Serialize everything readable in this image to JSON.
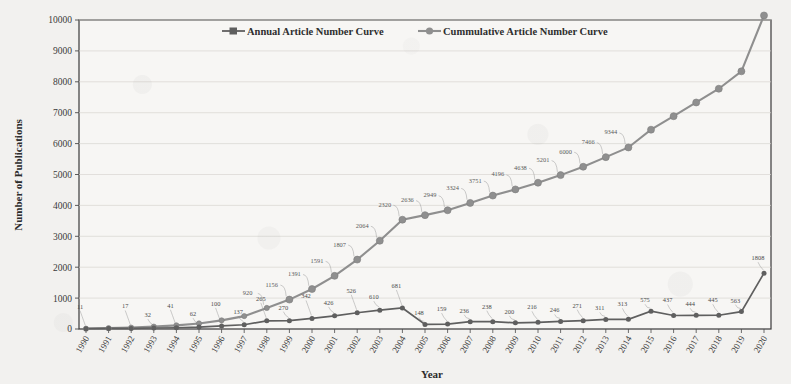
{
  "chart_data": {
    "type": "line",
    "title": "",
    "xlabel": "Year",
    "ylabel": "Number of Publications",
    "ylim": [
      0,
      10000
    ],
    "ytick_labels": [
      "0",
      "1000",
      "2000",
      "3000",
      "4000",
      "5000",
      "6000",
      "7000",
      "8000",
      "9000",
      "10000"
    ],
    "grid": true,
    "legend_position": "top-center",
    "categories": [
      "1990",
      "1991",
      "1992",
      "1993",
      "1994",
      "1995",
      "1996",
      "1997",
      "1998",
      "1999",
      "2000",
      "2001",
      "2002",
      "2003",
      "2004",
      "2005",
      "2006",
      "2007",
      "2008",
      "2009",
      "2010",
      "2011",
      "2012",
      "2013",
      "2014",
      "2015",
      "2016",
      "2017",
      "2018",
      "2019",
      "2020"
    ],
    "series": [
      {
        "name": "Annual Article Number Curve",
        "color": "#6b6b6b",
        "values": [
          11,
          17,
          32,
          41,
          62,
          100,
          137,
          265,
          270,
          342,
          426,
          526,
          610,
          681,
          920,
          148,
          159,
          236,
          238,
          200,
          216,
          246,
          271,
          311,
          313,
          575,
          437,
          444,
          445,
          563,
          799
        ]
      },
      {
        "name": "Cummulative Article Number Curve",
        "color": "#8f8f8f",
        "values": [
          11,
          28,
          60,
          101,
          163,
          263,
          400,
          665,
          935,
          1156,
          1391,
          1591,
          1807,
          2064,
          2320,
          2636,
          2949,
          3324,
          3751,
          4196,
          4638,
          5201,
          6000,
          7466,
          9344,
          9344,
          9344,
          9344,
          9344,
          9344,
          9344
        ]
      }
    ],
    "annual_labels": [
      "11",
      "17",
      "32",
      "41",
      "62",
      "100",
      "137",
      "265",
      "270",
      "342",
      "426",
      "526",
      "610",
      "681",
      "920",
      "148",
      "159",
      "236",
      "238",
      "200",
      "216",
      "246",
      "271",
      "311",
      "313",
      "575",
      "437",
      "444",
      "445",
      "563",
      "799",
      "1808"
    ],
    "cumulative_labels": [
      "1156",
      "1391",
      "1591",
      "1807",
      "2064",
      "2320",
      "2636",
      "2949",
      "3324",
      "3751",
      "4196",
      "4638",
      "5201",
      "6000",
      "7466",
      "9344"
    ]
  },
  "series_annual": {
    "name": "Annual Article Number Curve",
    "points": [
      {
        "year": "1990",
        "value": 11,
        "label": "11"
      },
      {
        "year": "1991",
        "value": 17,
        "label": ""
      },
      {
        "year": "1992",
        "value": 17,
        "label": "17"
      },
      {
        "year": "1993",
        "value": 32,
        "label": "32"
      },
      {
        "year": "1994",
        "value": 41,
        "label": "41"
      },
      {
        "year": "1995",
        "value": 62,
        "label": "62"
      },
      {
        "year": "1996",
        "value": 100,
        "label": "100"
      },
      {
        "year": "1997",
        "value": 137,
        "label": "137"
      },
      {
        "year": "1998",
        "value": 265,
        "label": "265"
      },
      {
        "year": "1999",
        "value": 270,
        "label": "270"
      },
      {
        "year": "2000",
        "value": 342,
        "label": "342"
      },
      {
        "year": "2001",
        "value": 426,
        "label": "426"
      },
      {
        "year": "2002",
        "value": 526,
        "label": "526"
      },
      {
        "year": "2003",
        "value": 610,
        "label": "610"
      },
      {
        "year": "2004",
        "value": 681,
        "label": "681"
      },
      {
        "year": "2005",
        "value": 148,
        "label": "148"
      },
      {
        "year": "2006",
        "value": 159,
        "label": "159"
      },
      {
        "year": "2007",
        "value": 236,
        "label": "236"
      },
      {
        "year": "2008",
        "value": 238,
        "label": "238"
      },
      {
        "year": "2009",
        "value": 200,
        "label": "200"
      },
      {
        "year": "2010",
        "value": 216,
        "label": "216"
      },
      {
        "year": "2011",
        "value": 246,
        "label": "246"
      },
      {
        "year": "2012",
        "value": 271,
        "label": "271"
      },
      {
        "year": "2013",
        "value": 311,
        "label": "311"
      },
      {
        "year": "2014",
        "value": 313,
        "label": "313"
      },
      {
        "year": "2015",
        "value": 575,
        "label": "575"
      },
      {
        "year": "2016",
        "value": 437,
        "label": "437"
      },
      {
        "year": "2017",
        "value": 444,
        "label": "444"
      },
      {
        "year": "2018",
        "value": 445,
        "label": "445"
      },
      {
        "year": "2019",
        "value": 563,
        "label": "563"
      },
      {
        "year": "2020",
        "value": 1808,
        "label": "1808"
      }
    ]
  },
  "series_cumulative": {
    "name": "Cummulative Article Number Curve",
    "points": [
      {
        "year": "1990",
        "value": 11,
        "label": ""
      },
      {
        "year": "1991",
        "value": 28,
        "label": ""
      },
      {
        "year": "1992",
        "value": 60,
        "label": ""
      },
      {
        "year": "1993",
        "value": 101,
        "label": ""
      },
      {
        "year": "1994",
        "value": 163,
        "label": ""
      },
      {
        "year": "1995",
        "value": 263,
        "label": ""
      },
      {
        "year": "1996",
        "value": 400,
        "label": ""
      },
      {
        "year": "1997",
        "value": 665,
        "label": ""
      },
      {
        "year": "1998",
        "value": 920,
        "label": "920"
      },
      {
        "year": "1999",
        "value": 1156,
        "label": "1156"
      },
      {
        "year": "2000",
        "value": 1391,
        "label": "1391"
      },
      {
        "year": "2001",
        "value": 1591,
        "label": "1591"
      },
      {
        "year": "2002",
        "value": 1807,
        "label": "1807"
      },
      {
        "year": "2003",
        "value": 2064,
        "label": "2064"
      },
      {
        "year": "2004",
        "value": 2320,
        "label": "2320"
      },
      {
        "year": "2005",
        "value": 2636,
        "label": "2636"
      },
      {
        "year": "2006",
        "value": 2949,
        "label": "2949"
      },
      {
        "year": "2007",
        "value": 3324,
        "label": "3324"
      },
      {
        "year": "2008",
        "value": 3751,
        "label": "3751"
      },
      {
        "year": "2009",
        "value": 4196,
        "label": "4196"
      },
      {
        "year": "2010",
        "value": 4638,
        "label": "4638"
      },
      {
        "year": "2011",
        "value": 5201,
        "label": "5201"
      },
      {
        "year": "2012",
        "value": 6000,
        "label": "6000"
      },
      {
        "year": "2013",
        "value": 7466,
        "label": "7466"
      },
      {
        "year": "2014",
        "value": 9344,
        "label": "9344"
      }
    ]
  },
  "legend": {
    "items": [
      {
        "label": "Annual Article Number Curve",
        "color": "#6b6b6b"
      },
      {
        "label": "Cummulative Article Number Curve",
        "color": "#8f8f8f"
      }
    ]
  },
  "axes": {
    "y_title": "Number of Publications",
    "x_title": "Year",
    "y_ticks": [
      "10000",
      "9000",
      "8000",
      "7000",
      "6000",
      "5000",
      "4000",
      "3000",
      "2000",
      "1000",
      "0"
    ],
    "x_ticks": [
      "1990",
      "1991",
      "1992",
      "1993",
      "1994",
      "1995",
      "1996",
      "1997",
      "1998",
      "1999",
      "2000",
      "2001",
      "2002",
      "2003",
      "2004",
      "2005",
      "2006",
      "2007",
      "2008",
      "2009",
      "2010",
      "2011",
      "2012",
      "2013",
      "2014",
      "2015",
      "2016",
      "2017",
      "2018",
      "2019",
      "2020"
    ]
  }
}
